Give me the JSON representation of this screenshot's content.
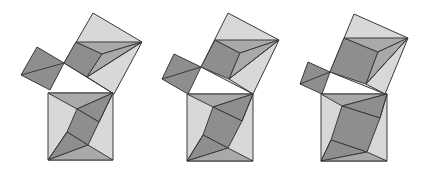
{
  "diagram": {
    "colors": {
      "light": "#d8d8d8",
      "medium": "#a9a9a9",
      "dark": "#8e8e8e",
      "stroke": "#3a3a3a",
      "background": "#ffffff"
    },
    "figures": [
      {
        "id": "figure-1",
        "small_square": [
          [
            37,
            47
          ],
          [
            64,
            63
          ],
          [
            50,
            90
          ],
          [
            21,
            75
          ]
        ],
        "small_diag": [
          [
            21,
            75
          ],
          [
            64,
            63
          ]
        ],
        "medium_square": [
          [
            93,
            13
          ],
          [
            142,
            42
          ],
          [
            114,
            94
          ],
          [
            64,
            63
          ]
        ],
        "medium_inner": [
          [
            76,
            42
          ],
          [
            142,
            42
          ],
          [
            102,
            54
          ],
          [
            87,
            77
          ]
        ],
        "hyp_square": [
          [
            48,
            93
          ],
          [
            113,
            93
          ],
          [
            113,
            160
          ],
          [
            48,
            160
          ]
        ],
        "hyp_inner": [
          [
            77,
            109
          ],
          [
            99,
            122
          ],
          [
            67,
            132
          ],
          [
            88,
            145
          ]
        ]
      },
      {
        "id": "figure-2",
        "small_square": [
          [
            174,
            54
          ],
          [
            201,
            67
          ],
          [
            188,
            94
          ],
          [
            162,
            79
          ]
        ],
        "small_diag": [
          [
            162,
            79
          ],
          [
            201,
            67
          ]
        ],
        "medium_square": [
          [
            228,
            13
          ],
          [
            279,
            40
          ],
          [
            253,
            94
          ],
          [
            201,
            67
          ]
        ],
        "medium_inner": [
          [
            215,
            40
          ],
          [
            279,
            40
          ],
          [
            240,
            53
          ],
          [
            229,
            79
          ]
        ],
        "hyp_square": [
          [
            187,
            94
          ],
          [
            253,
            94
          ],
          [
            253,
            161
          ],
          [
            187,
            161
          ]
        ],
        "hyp_inner": [
          [
            213,
            107
          ],
          [
            242,
            121
          ],
          [
            203,
            135
          ],
          [
            228,
            148
          ]
        ]
      },
      {
        "id": "figure-3",
        "small_square": [
          [
            308,
            62
          ],
          [
            330,
            72
          ],
          [
            322,
            94
          ],
          [
            300,
            84
          ]
        ],
        "small_diag": [
          [
            300,
            84
          ],
          [
            330,
            72
          ]
        ],
        "medium_square": [
          [
            354,
            14
          ],
          [
            408,
            38
          ],
          [
            385,
            94
          ],
          [
            330,
            72
          ]
        ],
        "medium_inner": [
          [
            344,
            38
          ],
          [
            408,
            38
          ],
          [
            378,
            52
          ],
          [
            366,
            84
          ]
        ],
        "hyp_square": [
          [
            321,
            94
          ],
          [
            387,
            94
          ],
          [
            387,
            161
          ],
          [
            321,
            161
          ]
        ],
        "hyp_inner": [
          [
            342,
            106
          ],
          [
            380,
            118
          ],
          [
            331,
            140
          ],
          [
            367,
            152
          ]
        ]
      }
    ]
  }
}
